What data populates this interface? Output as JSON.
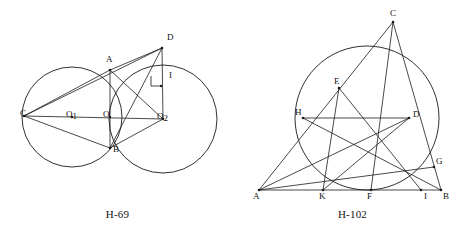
{
  "page": {
    "background": "#ffffff",
    "ink": "#1a1a1a"
  },
  "figures": [
    {
      "id": "fig-left",
      "caption": "H-69",
      "description": "Two intersecting circles with chords and a right-angle mark",
      "labels": [
        {
          "key": "A",
          "text": "A",
          "x": 106,
          "y": 62
        },
        {
          "key": "B",
          "text": "B",
          "x": 113,
          "y": 152
        },
        {
          "key": "C",
          "text": "C",
          "x": 20,
          "y": 116
        },
        {
          "key": "D",
          "text": "D",
          "x": 167,
          "y": 40
        },
        {
          "key": "I",
          "text": "I",
          "x": 169,
          "y": 78
        },
        {
          "key": "O",
          "text": "O",
          "x": 103,
          "y": 117
        },
        {
          "key": "O1",
          "text": "O",
          "sub": "1",
          "x": 72,
          "y": 117
        },
        {
          "key": "O2",
          "text": "O",
          "sub": "2",
          "x": 163,
          "y": 119
        }
      ]
    },
    {
      "id": "fig-right",
      "caption": "H-102",
      "description": "Triangle ABC with cevians, an inscribed circle-like arc and interior points",
      "labels": [
        {
          "key": "A",
          "text": "A",
          "x": 18,
          "y": 196
        },
        {
          "key": "B",
          "text": "B",
          "x": 209,
          "y": 196
        },
        {
          "key": "C",
          "text": "C",
          "x": 153,
          "y": 16
        },
        {
          "key": "D",
          "text": "D",
          "x": 178,
          "y": 118
        },
        {
          "key": "E",
          "text": "E",
          "x": 96,
          "y": 87
        },
        {
          "key": "F",
          "text": "F",
          "x": 129,
          "y": 196
        },
        {
          "key": "G",
          "text": "G",
          "x": 204,
          "y": 165
        },
        {
          "key": "H",
          "text": "H",
          "x": 60,
          "y": 115
        },
        {
          "key": "I",
          "text": "I",
          "x": 190,
          "y": 196
        },
        {
          "key": "K",
          "text": "K",
          "x": 80,
          "y": 196
        }
      ]
    }
  ]
}
